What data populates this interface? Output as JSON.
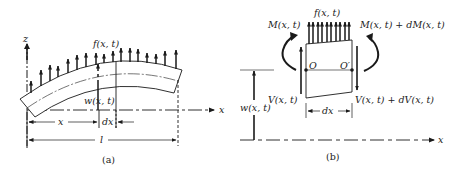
{
  "figure_a": {
    "caption": "(a)",
    "labels": {
      "z_axis": "z",
      "x_axis": "x",
      "load": "f(x, t)",
      "deflection": "w(x, t)",
      "position": "x",
      "element_width": "dx",
      "length": "l"
    }
  },
  "figure_b": {
    "caption": "(b)",
    "labels": {
      "load": "f(x, t)",
      "moment_left": "M(x, t)",
      "moment_right": "M(x, t) + dM(x, t)",
      "shear_left": "V(x, t)",
      "shear_right": "V(x, t) + dV(x, t)",
      "point_left": "O",
      "point_right": "O′",
      "element_width": "dx",
      "deflection": "w(x, t)",
      "x_axis": "x"
    }
  },
  "colors": {
    "ink": "#1a1a1a",
    "background": "#ffffff"
  }
}
